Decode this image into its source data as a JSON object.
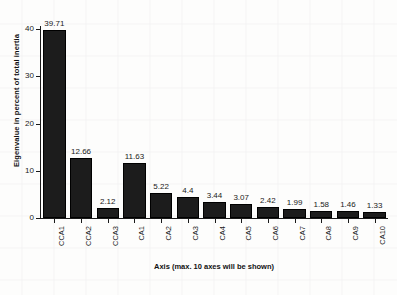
{
  "chart_data": {
    "type": "bar",
    "title": "",
    "subtitle": "",
    "xlabel": "Axis (max. 10 axes will be shown)",
    "ylabel": "Eigenvalue in percent of total inertia",
    "categories": [
      "CCA1",
      "CCA2",
      "CCA3",
      "CA1",
      "CA2",
      "CA3",
      "CA4",
      "CA5",
      "CA6",
      "CA7",
      "CA8",
      "CA9",
      "CA10"
    ],
    "values": [
      39.71,
      12.66,
      2.12,
      11.63,
      5.22,
      4.4,
      3.44,
      3.07,
      2.42,
      1.99,
      1.58,
      1.46,
      1.33
    ],
    "value_labels": [
      "39.71",
      "12.66",
      "2.12",
      "11.63",
      "5.22",
      "4.4",
      "3.44",
      "3.07",
      "2.42",
      "1.99",
      "1.58",
      "1.46",
      "1.33"
    ],
    "ylim": [
      0,
      41.5
    ],
    "y_ticks": [
      0,
      10,
      20,
      30,
      40
    ],
    "y_tick_labels": [
      "0",
      "10",
      "20",
      "30",
      "40"
    ],
    "grid": true,
    "legend": "none",
    "bar_color": "#1c1c1c",
    "background_color": "#fdfdfc",
    "axis_color": "#1a1a1a"
  }
}
